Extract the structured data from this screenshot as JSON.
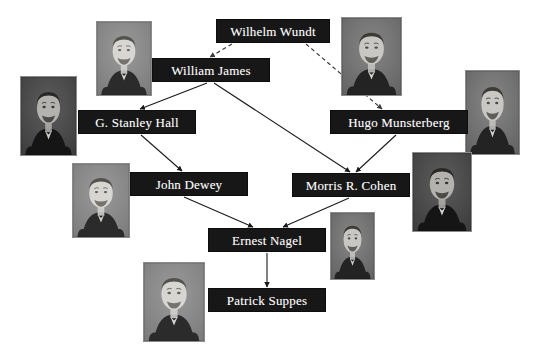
{
  "diagram": {
    "type": "academic-genealogy-tree",
    "canvas": {
      "width": 538,
      "height": 348,
      "background": "#ffffff"
    },
    "node_style": {
      "fill": "#171717",
      "text": "#ffffff",
      "font_size_px": 13
    },
    "edge_style": {
      "solid_color": "#1a1a1a",
      "dashed_color": "#3a3a3a",
      "arrowhead": "filled-triangle"
    }
  },
  "nodes": [
    {
      "id": "wundt",
      "label": "Wilhelm Wundt",
      "x": 216,
      "y": 19,
      "w": 114,
      "h": 24
    },
    {
      "id": "james",
      "label": "William James",
      "x": 152,
      "y": 58,
      "w": 118,
      "h": 24
    },
    {
      "id": "hall",
      "label": "G. Stanley Hall",
      "x": 78,
      "y": 110,
      "w": 118,
      "h": 24
    },
    {
      "id": "munsterberg",
      "label": "Hugo Munsterberg",
      "x": 330,
      "y": 110,
      "w": 138,
      "h": 24
    },
    {
      "id": "dewey",
      "label": "John Dewey",
      "x": 130,
      "y": 172,
      "w": 118,
      "h": 24
    },
    {
      "id": "cohen",
      "label": "Morris R. Cohen",
      "x": 292,
      "y": 173,
      "w": 118,
      "h": 24
    },
    {
      "id": "nagel",
      "label": "Ernest Nagel",
      "x": 208,
      "y": 228,
      "w": 118,
      "h": 24
    },
    {
      "id": "suppes",
      "label": "Patrick Suppes",
      "x": 208,
      "y": 288,
      "w": 118,
      "h": 24
    }
  ],
  "photos": [
    {
      "id": "photo-james",
      "person": "William James",
      "x": 96,
      "y": 21,
      "w": 56,
      "h": 75,
      "tone": "light-gray"
    },
    {
      "id": "photo-wundt",
      "person": "Wilhelm Wundt",
      "x": 341,
      "y": 17,
      "w": 61,
      "h": 79,
      "tone": "mid-gray"
    },
    {
      "id": "photo-hall",
      "person": "G. Stanley Hall",
      "x": 20,
      "y": 76,
      "w": 57,
      "h": 80,
      "tone": "dark-gray"
    },
    {
      "id": "photo-munsterberg",
      "person": "Hugo Munsterberg",
      "x": 465,
      "y": 70,
      "w": 55,
      "h": 85,
      "tone": "mid-gray"
    },
    {
      "id": "photo-dewey",
      "person": "John Dewey",
      "x": 72,
      "y": 163,
      "w": 58,
      "h": 75,
      "tone": "light-gray"
    },
    {
      "id": "photo-cohen",
      "person": "Morris R. Cohen",
      "x": 412,
      "y": 152,
      "w": 60,
      "h": 80,
      "tone": "dark-gray"
    },
    {
      "id": "photo-nagel",
      "person": "Ernest Nagel",
      "x": 330,
      "y": 212,
      "w": 45,
      "h": 68,
      "tone": "mid-gray"
    },
    {
      "id": "photo-suppes",
      "person": "Patrick Suppes",
      "x": 143,
      "y": 262,
      "w": 62,
      "h": 80,
      "tone": "light-gray"
    }
  ],
  "edges": [
    {
      "id": "e1",
      "from": "wundt",
      "to": "james",
      "style": "dashed",
      "x1": 232,
      "y1": 44,
      "x2": 210,
      "y2": 57
    },
    {
      "id": "e2",
      "from": "wundt",
      "to": "munsterberg",
      "style": "dashed",
      "x1": 306,
      "y1": 44,
      "x2": 382,
      "y2": 109
    },
    {
      "id": "e3",
      "from": "james",
      "to": "hall",
      "style": "solid",
      "x1": 207,
      "y1": 83,
      "x2": 140,
      "y2": 109
    },
    {
      "id": "e4",
      "from": "james",
      "to": "cohen",
      "style": "solid",
      "x1": 214,
      "y1": 83,
      "x2": 350,
      "y2": 172
    },
    {
      "id": "e5",
      "from": "hall",
      "to": "dewey",
      "style": "solid",
      "x1": 141,
      "y1": 135,
      "x2": 182,
      "y2": 171
    },
    {
      "id": "e6",
      "from": "munsterberg",
      "to": "cohen",
      "style": "solid",
      "x1": 396,
      "y1": 135,
      "x2": 356,
      "y2": 172
    },
    {
      "id": "e7",
      "from": "dewey",
      "to": "nagel",
      "style": "solid",
      "x1": 184,
      "y1": 197,
      "x2": 253,
      "y2": 227
    },
    {
      "id": "e8",
      "from": "cohen",
      "to": "nagel",
      "style": "solid",
      "x1": 349,
      "y1": 198,
      "x2": 283,
      "y2": 227
    },
    {
      "id": "e9",
      "from": "nagel",
      "to": "suppes",
      "style": "solid",
      "x1": 267,
      "y1": 253,
      "x2": 267,
      "y2": 287
    }
  ]
}
